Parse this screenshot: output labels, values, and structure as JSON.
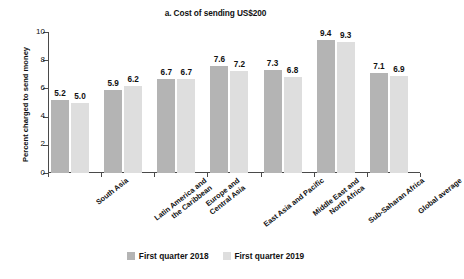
{
  "chart_data": {
    "type": "bar",
    "title": "a. Cost of sending US$200",
    "xlabel": "",
    "ylabel": "Percent charged to send money",
    "ylim": [
      0,
      10
    ],
    "yticks": [
      0,
      2,
      4,
      6,
      8,
      10
    ],
    "grid": false,
    "legend_position": "bottom",
    "categories": [
      "South Asia",
      "Latin America and\nthe Caribbean",
      "Europe and\nCentral Asia",
      "East Asia and Pacific",
      "Middle East and\nNorth Africa",
      "Sub-Saharan Africa",
      "Global average"
    ],
    "series": [
      {
        "name": "First quarter 2018",
        "color": "#b4b4b4",
        "values": [
          5.2,
          5.9,
          6.7,
          7.6,
          7.3,
          9.4,
          7.1
        ]
      },
      {
        "name": "First quarter 2019",
        "color": "#dedede",
        "values": [
          5.0,
          6.2,
          6.7,
          7.2,
          6.8,
          9.3,
          6.9
        ]
      }
    ]
  },
  "axis": {
    "ytick_labels": [
      "0",
      "2",
      "4",
      "6",
      "8",
      "10"
    ]
  },
  "category_lines": [
    [
      "South Asia"
    ],
    [
      "Latin America and",
      "the Caribbean"
    ],
    [
      "Europe and",
      "Central Asia"
    ],
    [
      "East Asia and Pacific"
    ],
    [
      "Middle East and",
      "North Africa"
    ],
    [
      "Sub-Saharan Africa"
    ],
    [
      "Global average"
    ]
  ]
}
